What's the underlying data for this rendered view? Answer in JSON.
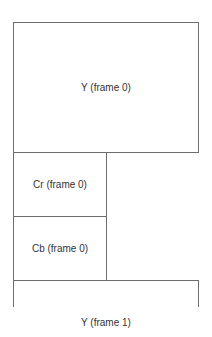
{
  "diagram": {
    "title": "",
    "regions": [
      {
        "id": "y0",
        "label": "Y (frame 0)"
      },
      {
        "id": "cr0",
        "label": "Cr (frame 0)"
      },
      {
        "id": "cb0",
        "label": "Cb (frame 0)"
      },
      {
        "id": "y1",
        "label": "Y (frame 1)"
      }
    ],
    "line_color": "#6e6e6e",
    "text_color": "#333333"
  }
}
